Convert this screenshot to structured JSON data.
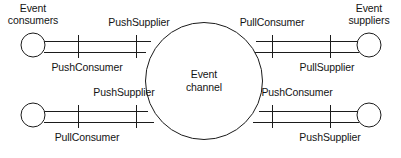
{
  "diagram": {
    "hub": {
      "name": "event-channel",
      "label_line1": "Event",
      "label_line2": "channel"
    },
    "endpoints": [
      {
        "id": "event-consumers",
        "label_line1": "Event",
        "label_line2": "consumers",
        "side": "left",
        "row": "top"
      },
      {
        "id": "event-suppliers",
        "label_line1": "Event",
        "label_line2": "suppliers",
        "side": "right",
        "row": "top"
      }
    ],
    "connections": [
      {
        "id": "top-left",
        "above_label": "PushSupplier",
        "below_label": "PushConsumer"
      },
      {
        "id": "top-right",
        "above_label": "PullConsumer",
        "below_label": "PullSupplier"
      },
      {
        "id": "bottom-left",
        "above_label": "PushSupplier",
        "below_label": "PullConsumer"
      },
      {
        "id": "bottom-right",
        "above_label": "PushConsumer",
        "below_label": "PushSupplier"
      }
    ],
    "colors": {
      "stroke": "#1b1b1b",
      "background": "#ffffff",
      "text": "#141414"
    }
  }
}
